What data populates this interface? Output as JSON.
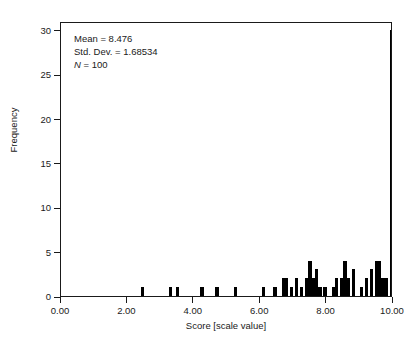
{
  "chart_data": {
    "type": "bar",
    "title": "",
    "xlabel": "Score [scale value]",
    "ylabel": "Frequency",
    "xlim": [
      0,
      10
    ],
    "ylim": [
      0,
      31
    ],
    "grid": false,
    "legend": null,
    "bar_color": "#000000",
    "background_color": "#ffffff",
    "axis_color": "#1a1a1a",
    "xticks": [
      0,
      2,
      4,
      6,
      8,
      10
    ],
    "xtick_labels": [
      "0.00",
      "2.00",
      "4.00",
      "6.00",
      "8.00",
      "10.00"
    ],
    "yticks": [
      0,
      5,
      10,
      15,
      20,
      25,
      30
    ],
    "ytick_labels": [
      "0",
      "5",
      "10",
      "15",
      "20",
      "25",
      "30"
    ],
    "bin_width": 0.1,
    "bins": [
      {
        "x": 2.45,
        "value": 1
      },
      {
        "x": 3.3,
        "value": 1
      },
      {
        "x": 3.5,
        "value": 1
      },
      {
        "x": 4.25,
        "value": 1
      },
      {
        "x": 4.7,
        "value": 1
      },
      {
        "x": 5.25,
        "value": 1
      },
      {
        "x": 6.1,
        "value": 1
      },
      {
        "x": 6.45,
        "value": 1
      },
      {
        "x": 6.7,
        "value": 2
      },
      {
        "x": 6.8,
        "value": 2
      },
      {
        "x": 6.95,
        "value": 1
      },
      {
        "x": 7.1,
        "value": 2
      },
      {
        "x": 7.25,
        "value": 1
      },
      {
        "x": 7.4,
        "value": 2
      },
      {
        "x": 7.5,
        "value": 4
      },
      {
        "x": 7.6,
        "value": 2
      },
      {
        "x": 7.7,
        "value": 3
      },
      {
        "x": 7.8,
        "value": 1
      },
      {
        "x": 7.95,
        "value": 1
      },
      {
        "x": 8.2,
        "value": 1
      },
      {
        "x": 8.3,
        "value": 2
      },
      {
        "x": 8.45,
        "value": 2
      },
      {
        "x": 8.55,
        "value": 4
      },
      {
        "x": 8.65,
        "value": 2
      },
      {
        "x": 8.8,
        "value": 3
      },
      {
        "x": 9.05,
        "value": 1
      },
      {
        "x": 9.2,
        "value": 2
      },
      {
        "x": 9.35,
        "value": 3
      },
      {
        "x": 9.5,
        "value": 4
      },
      {
        "x": 9.6,
        "value": 4
      },
      {
        "x": 9.7,
        "value": 2
      },
      {
        "x": 9.8,
        "value": 2
      },
      {
        "x": 9.95,
        "value": 30
      }
    ]
  },
  "annotation": {
    "mean_label": "Mean =",
    "mean_value": "8.476",
    "sd_label": "Std. Dev. =",
    "sd_value": "1.68534",
    "n_label": "N",
    "n_equals": "= 100"
  }
}
